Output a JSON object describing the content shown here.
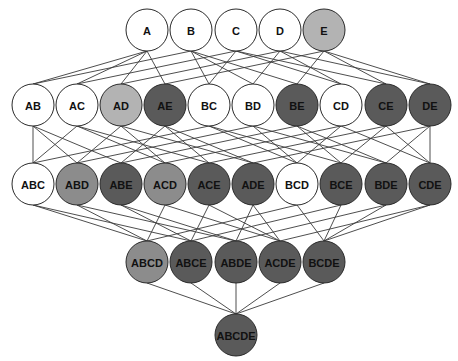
{
  "diagram": {
    "title": "",
    "type": "hasse-diagram-subset-lattice",
    "fills": {
      "white": "#ffffff",
      "light": "#b3b3b3",
      "medium": "#8c8c8c",
      "dark": "#5a5a5a"
    },
    "node_radius": 21,
    "levels": [
      {
        "y": 30,
        "nodes": [
          {
            "label": "A",
            "x": 147,
            "fill": "white"
          },
          {
            "label": "B",
            "x": 191,
            "fill": "white"
          },
          {
            "label": "C",
            "x": 236,
            "fill": "white"
          },
          {
            "label": "D",
            "x": 280,
            "fill": "white"
          },
          {
            "label": "E",
            "x": 324,
            "fill": "light"
          }
        ]
      },
      {
        "y": 105,
        "nodes": [
          {
            "label": "AB",
            "x": 33,
            "fill": "white"
          },
          {
            "label": "AC",
            "x": 77,
            "fill": "white"
          },
          {
            "label": "AD",
            "x": 121,
            "fill": "light"
          },
          {
            "label": "AE",
            "x": 165,
            "fill": "dark"
          },
          {
            "label": "BC",
            "x": 209,
            "fill": "white"
          },
          {
            "label": "BD",
            "x": 253,
            "fill": "white"
          },
          {
            "label": "BE",
            "x": 297,
            "fill": "dark"
          },
          {
            "label": "CD",
            "x": 341,
            "fill": "white"
          },
          {
            "label": "CE",
            "x": 386,
            "fill": "dark"
          },
          {
            "label": "DE",
            "x": 430,
            "fill": "dark"
          }
        ]
      },
      {
        "y": 184,
        "nodes": [
          {
            "label": "ABC",
            "x": 33,
            "fill": "white"
          },
          {
            "label": "ABD",
            "x": 77,
            "fill": "medium"
          },
          {
            "label": "ABE",
            "x": 121,
            "fill": "dark"
          },
          {
            "label": "ACD",
            "x": 165,
            "fill": "medium"
          },
          {
            "label": "ACE",
            "x": 209,
            "fill": "dark"
          },
          {
            "label": "ADE",
            "x": 253,
            "fill": "dark"
          },
          {
            "label": "BCD",
            "x": 297,
            "fill": "white"
          },
          {
            "label": "BCE",
            "x": 341,
            "fill": "dark"
          },
          {
            "label": "BDE",
            "x": 386,
            "fill": "dark"
          },
          {
            "label": "CDE",
            "x": 430,
            "fill": "dark"
          }
        ]
      },
      {
        "y": 262,
        "nodes": [
          {
            "label": "ABCD",
            "x": 147,
            "fill": "medium"
          },
          {
            "label": "ABCE",
            "x": 191,
            "fill": "dark"
          },
          {
            "label": "ABDE",
            "x": 236,
            "fill": "dark"
          },
          {
            "label": "ACDE",
            "x": 280,
            "fill": "dark"
          },
          {
            "label": "BCDE",
            "x": 324,
            "fill": "dark"
          }
        ]
      },
      {
        "y": 335,
        "nodes": [
          {
            "label": "ABCDE",
            "x": 236,
            "fill": "dark"
          }
        ]
      }
    ]
  }
}
